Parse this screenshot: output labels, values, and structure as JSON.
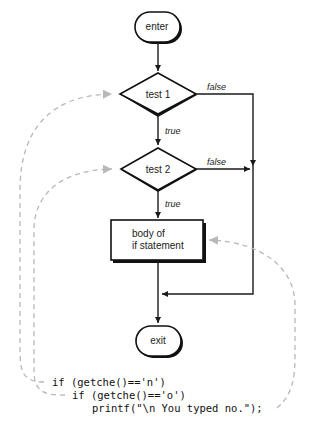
{
  "nodes": {
    "enter": "enter",
    "test1": "test 1",
    "test2": "test 2",
    "body_line1": "body of",
    "body_line2": "if statement",
    "exit": "exit"
  },
  "edge_labels": {
    "test1_false": "false",
    "test1_true": "true",
    "test2_false": "false",
    "test2_true": "true"
  },
  "code": {
    "line1": "if (getche()=='n')",
    "line2": "if (getche()=='o')",
    "line3": "printf(\"\\n You typed no.\");"
  },
  "colors": {
    "line": "#1a1a1a",
    "dashed_arrow": "#b8b8b8"
  }
}
